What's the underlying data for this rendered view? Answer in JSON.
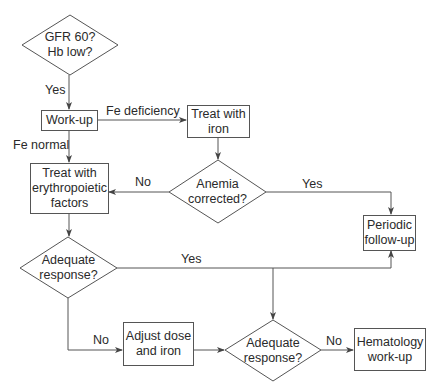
{
  "nodes": {
    "gfr_decision": {
      "text": "GFR 60?\nHb low?",
      "shape": "diamond"
    },
    "workup": {
      "text": "Work-up",
      "shape": "box"
    },
    "treat_iron": {
      "text": "Treat with\niron",
      "shape": "box"
    },
    "anemia_decision": {
      "text": "Anemia\ncorrected?",
      "shape": "diamond"
    },
    "treat_epo": {
      "text": "Treat with\nerythropoietic\nfactors",
      "shape": "box"
    },
    "periodic_followup": {
      "text": "Periodic\nfollow-up",
      "shape": "box"
    },
    "adequate_decision_1": {
      "text": "Adequate\nresponse?",
      "shape": "diamond"
    },
    "adjust_dose": {
      "text": "Adjust dose\nand iron",
      "shape": "box"
    },
    "adequate_decision_2": {
      "text": "Adequate\nresponse?",
      "shape": "diamond"
    },
    "hematology_workup": {
      "text": "Hematology\nwork-up",
      "shape": "box"
    }
  },
  "edges": {
    "gfr_yes": "Yes",
    "fe_deficiency": "Fe deficiency",
    "fe_normal": "Fe normal",
    "anemia_no": "No",
    "anemia_yes": "Yes",
    "adequate1_yes": "Yes",
    "adequate1_no": "No",
    "adequate2_no": "No"
  },
  "colors": {
    "line": "#555555",
    "text": "#2a2a2a",
    "background": "#ffffff"
  }
}
